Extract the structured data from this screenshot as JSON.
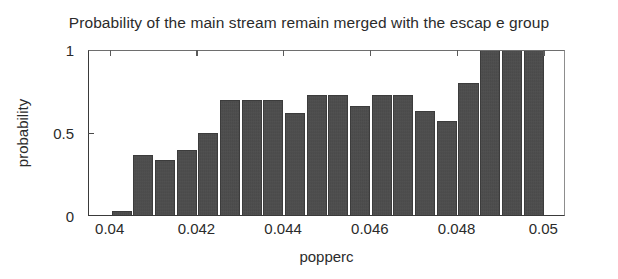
{
  "chart_data": {
    "type": "bar",
    "title": "Probability of the main stream remain merged with the escap e group",
    "xlabel": "popperc",
    "ylabel": "probability",
    "grid": false,
    "legend": null,
    "xlim": [
      0.0395,
      0.0505
    ],
    "ylim": [
      0,
      1
    ],
    "xticks": [
      0.04,
      0.042,
      0.044,
      0.046,
      0.048,
      0.05
    ],
    "xticklabels": [
      "0.04",
      "0.042",
      "0.044",
      "0.046",
      "0.048",
      "0.05"
    ],
    "yticks": [
      0,
      0.5,
      1
    ],
    "yticklabels": [
      "0",
      "0.5",
      "1"
    ],
    "bar_color": "#474747",
    "categories": [
      0.04,
      0.0405,
      0.041,
      0.0415,
      0.042,
      0.0425,
      0.043,
      0.0435,
      0.044,
      0.0445,
      0.045,
      0.0455,
      0.046,
      0.0465,
      0.047,
      0.0475,
      0.048,
      0.0485,
      0.049,
      0.0495
    ],
    "values": [
      0.03,
      0.37,
      0.34,
      0.4,
      0.5,
      0.7,
      0.7,
      0.7,
      0.62,
      0.73,
      0.73,
      0.66,
      0.73,
      0.73,
      0.63,
      0.57,
      0.8,
      1.0,
      1.0,
      1.0
    ]
  }
}
